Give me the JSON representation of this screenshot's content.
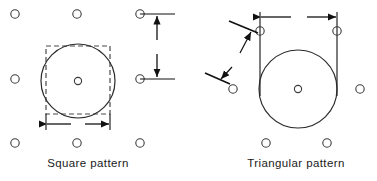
{
  "figure": {
    "width": 377,
    "height": 181,
    "background": "#ffffff",
    "line_color": "#111111",
    "hole_color": "#3a3a3a"
  },
  "panels": [
    {
      "id": "square-pattern",
      "caption": "Square  pattern",
      "dimensions": [
        {
          "name": "D",
          "label": "D",
          "orientation": "horizontal",
          "meaning": "tube outside diameter"
        },
        {
          "name": "s",
          "label": "s",
          "orientation": "vertical",
          "meaning": "pitch between tube centers"
        }
      ],
      "hole_grid": {
        "columns_x": [
          15,
          77,
          140
        ],
        "rows_y": [
          14,
          79,
          143
        ],
        "hole_radius": 4.2
      },
      "main_circle": {
        "cx": 78,
        "cy": 82,
        "r": 37
      },
      "dashed_square": {
        "x": 46,
        "y": 46,
        "width": 64,
        "height": 68
      },
      "center_dot": {
        "cx": 78,
        "cy": 82,
        "r": 3.4
      },
      "d_dimension": {
        "x1": 46,
        "x2": 110,
        "y": 124,
        "label_x": 78,
        "label_y": 124
      },
      "s_dimension": {
        "x": 157,
        "y1": 14,
        "y2": 79,
        "label_x": 157,
        "label_y": 47
      }
    },
    {
      "id": "triangular-pattern",
      "caption": "Triangular  pattern",
      "dimensions": [
        {
          "name": "D",
          "label": "D",
          "orientation": "horizontal",
          "meaning": "tube outside diameter"
        },
        {
          "name": "s",
          "label": "s",
          "orientation": "diagonal",
          "meaning": "pitch between tube centers"
        }
      ],
      "holes": [
        {
          "cx": 260,
          "cy": 31
        },
        {
          "cx": 337,
          "cy": 31
        },
        {
          "cx": 233,
          "cy": 89
        },
        {
          "cx": 360,
          "cy": 89
        },
        {
          "cx": 266,
          "cy": 143
        },
        {
          "cx": 327,
          "cy": 143
        }
      ],
      "hole_radius": 4.2,
      "main_circle": {
        "cx": 298,
        "cy": 89,
        "r": 39
      },
      "center_dot": {
        "cx": 298,
        "cy": 89,
        "r": 3.4
      },
      "d_dimension": {
        "x1": 260,
        "x2": 337,
        "y": 17,
        "label_x": 299,
        "label_y": 17
      },
      "s_dimension": {
        "from": {
          "x": 256,
          "y": 32
        },
        "to": {
          "x": 222,
          "y": 79
        },
        "label_x": 237,
        "label_y": 61
      },
      "extension_lines": [
        {
          "x": 260,
          "y1": 17,
          "y2": 95
        },
        {
          "x": 337,
          "y1": 17,
          "y2": 95
        }
      ]
    }
  ]
}
